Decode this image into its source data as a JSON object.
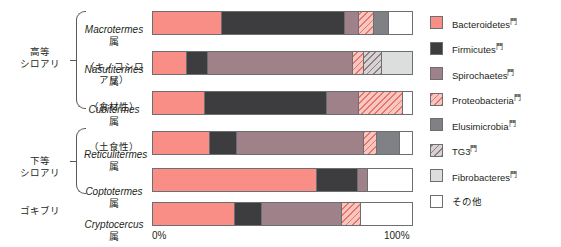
{
  "chart_data": {
    "type": "bar",
    "subtype": "stacked-horizontal-100-percent",
    "title": "",
    "xlabel": "",
    "ylabel": "",
    "xlim": [
      0,
      100
    ],
    "xticks": [
      "0%",
      "100%"
    ],
    "grid": false,
    "legend_position": "right",
    "categories": [
      "Macrotermes属（キノコシロアリ）",
      "Nasutitermes属（食材性）",
      "Cubitermes属（土食性）",
      "Reticulitermes属",
      "Coptotermes属",
      "Cryptocercus属"
    ],
    "series": [
      {
        "name": "Bacteroidetes門",
        "key": "bacteroidetes",
        "color": "#f98e86",
        "values": [
          26.5,
          13.2,
          20.0,
          22.0,
          63.5,
          31.5
        ]
      },
      {
        "name": "Firmicutes門",
        "key": "firmicutes",
        "color": "#3d3d3f",
        "values": [
          47.5,
          8.2,
          47.0,
          10.5,
          15.5,
          10.5
        ]
      },
      {
        "name": "Spirochaetes門",
        "key": "spirochaetes",
        "color": "#9e8189",
        "values": [
          5.5,
          56.0,
          12.5,
          49.0,
          4.0,
          31.0
        ]
      },
      {
        "name": "Proteobacteria門",
        "key": "proteobacteria",
        "color": "#f7c6c0",
        "pattern": "diagonal-hatch",
        "values": [
          6.0,
          4.0,
          17.0,
          5.0,
          0.0,
          7.5
        ]
      },
      {
        "name": "Elusimicrobia門",
        "key": "elusimicrobia",
        "color": "#808184",
        "values": [
          5.5,
          0.0,
          0.0,
          9.0,
          0.0,
          0.0
        ]
      },
      {
        "name": "TG3門",
        "key": "tg3",
        "color": "#d9d2d4",
        "pattern": "diagonal-hatch",
        "values": [
          0.0,
          7.0,
          0.0,
          0.0,
          0.0,
          0.0
        ]
      },
      {
        "name": "Fibrobacteres門",
        "key": "fibrobacteres",
        "color": "#dcdddd",
        "values": [
          0.0,
          11.6,
          0.0,
          0.0,
          0.0,
          0.0
        ]
      },
      {
        "name": "その他",
        "key": "other",
        "color": "#ffffff",
        "values": [
          9.0,
          0.0,
          3.5,
          4.5,
          17.0,
          19.5
        ]
      }
    ]
  },
  "groups": [
    {
      "label": "高等\nシロアリ",
      "bracket": true
    },
    {
      "label": "下等\nシロアリ",
      "bracket": true
    },
    {
      "label": "ゴキブリ",
      "bracket": false
    }
  ],
  "taxa": [
    {
      "genus": "Macrotermes",
      "suffix": "属",
      "sub": "（キノコシロアリ）"
    },
    {
      "genus": "Nasutitermes",
      "suffix": "属",
      "sub": "（食材性）"
    },
    {
      "genus": "Cubitermes",
      "suffix": "属",
      "sub": "（土食性）"
    },
    {
      "genus": "Reticulitermes",
      "suffix": "属",
      "sub": ""
    },
    {
      "genus": "Coptotermes",
      "suffix": "属",
      "sub": ""
    },
    {
      "genus": "Cryptocercus",
      "suffix": "属",
      "sub": ""
    }
  ],
  "axis": {
    "left_tick": "0%",
    "right_tick": "100%"
  },
  "legend": {
    "items": [
      {
        "label": "Bacteroidetes",
        "mark": "門",
        "key": "bacteroidetes"
      },
      {
        "label": "Firmicutes",
        "mark": "門",
        "key": "firmicutes"
      },
      {
        "label": "Spirochaetes",
        "mark": "門",
        "key": "spirochaetes"
      },
      {
        "label": "Proteobacteria",
        "mark": "門",
        "key": "proteobacteria"
      },
      {
        "label": "Elusimicrobia",
        "mark": "門",
        "key": "elusimicrobia"
      },
      {
        "label": "TG3",
        "mark": "門",
        "key": "tg3"
      },
      {
        "label": "Fibrobacteres",
        "mark": "門",
        "key": "fibrobacteres"
      },
      {
        "label": "その他",
        "mark": "",
        "key": "other"
      }
    ]
  }
}
